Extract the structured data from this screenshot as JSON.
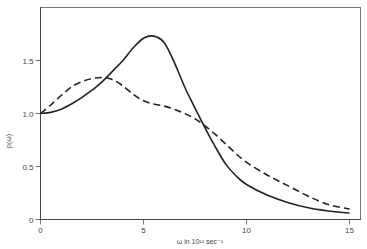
{
  "chart_data": {
    "type": "line",
    "title": "",
    "xlabel": "ω in 10¹² sec⁻¹",
    "ylabel": "p(ω)",
    "xlim": [
      0,
      15.5
    ],
    "ylim": [
      0,
      2.0
    ],
    "x_ticks": [
      "0",
      "5",
      "10",
      "15"
    ],
    "y_ticks": [
      "0",
      "0.5",
      "1.0",
      "1.5"
    ],
    "grid": false,
    "legend": null,
    "series": [
      {
        "name": "solid",
        "style": "solid",
        "x": [
          0,
          0.5,
          1,
          1.5,
          2,
          2.5,
          3,
          3.5,
          4,
          4.5,
          5,
          5.5,
          6,
          6.5,
          7,
          7.5,
          8,
          8.5,
          9,
          9.5,
          10,
          11,
          12,
          13,
          14,
          15
        ],
        "y": [
          1.0,
          1.01,
          1.04,
          1.09,
          1.15,
          1.22,
          1.3,
          1.4,
          1.5,
          1.62,
          1.71,
          1.73,
          1.67,
          1.48,
          1.25,
          1.05,
          0.86,
          0.68,
          0.52,
          0.41,
          0.33,
          0.23,
          0.16,
          0.11,
          0.08,
          0.06
        ]
      },
      {
        "name": "dashed",
        "style": "dashed",
        "x": [
          0,
          0.5,
          1,
          1.5,
          2,
          2.5,
          3,
          3.5,
          4,
          4.5,
          5,
          5.5,
          6,
          6.5,
          7,
          7.5,
          8,
          8.5,
          9,
          9.5,
          10,
          11,
          12,
          13,
          14,
          15
        ],
        "y": [
          1.0,
          1.08,
          1.17,
          1.25,
          1.3,
          1.33,
          1.34,
          1.32,
          1.26,
          1.18,
          1.12,
          1.09,
          1.07,
          1.04,
          1.0,
          0.95,
          0.88,
          0.8,
          0.71,
          0.62,
          0.54,
          0.42,
          0.32,
          0.22,
          0.14,
          0.1
        ]
      }
    ]
  }
}
